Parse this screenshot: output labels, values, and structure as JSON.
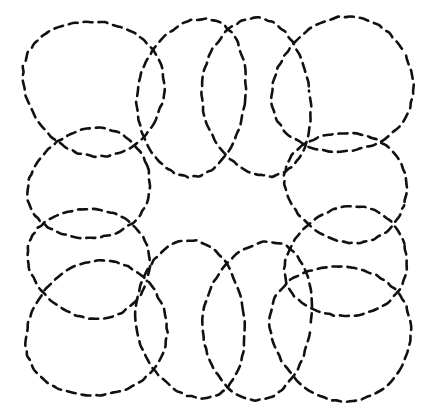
{
  "figure": {
    "kind": "line-drawing",
    "canvas": {
      "width": 433,
      "height": 416,
      "background_color": "#ffffff"
    },
    "stroke": {
      "color": "#111111",
      "width": 2.6,
      "dash_length": 9,
      "dash_gap": 6,
      "linecap": "round"
    },
    "composition": {
      "center_x": 216,
      "center_y": 207,
      "petal_count": 8,
      "bounding_box": {
        "x": 18,
        "y": 18,
        "width": 395,
        "height": 380
      },
      "central_void": "octagonal"
    },
    "petals": [
      {
        "name": "petal-top-left",
        "angle_deg": 202,
        "center_x": 92,
        "center_y": 86,
        "radius_x": 72,
        "radius_y": 66,
        "rotation_deg": 28
      },
      {
        "name": "petal-top-center-left",
        "angle_deg": 247,
        "center_x": 191,
        "center_y": 97,
        "radius_x": 54,
        "radius_y": 79,
        "rotation_deg": 8
      },
      {
        "name": "petal-top-center-right",
        "angle_deg": 292,
        "center_x": 256,
        "center_y": 98,
        "radius_x": 54,
        "radius_y": 79,
        "rotation_deg": -8
      },
      {
        "name": "petal-top-right",
        "angle_deg": 337,
        "center_x": 341,
        "center_y": 87,
        "radius_x": 72,
        "radius_y": 66,
        "rotation_deg": -28
      },
      {
        "name": "petal-left-upper",
        "angle_deg": 157,
        "center_x": 88,
        "center_y": 185,
        "radius_x": 62,
        "radius_y": 54,
        "rotation_deg": -18
      },
      {
        "name": "petal-right-upper",
        "angle_deg": 22,
        "center_x": 345,
        "center_y": 186,
        "radius_x": 62,
        "radius_y": 54,
        "rotation_deg": 18
      },
      {
        "name": "petal-left-lower",
        "angle_deg": 112,
        "center_x": 88,
        "center_y": 262,
        "radius_x": 62,
        "radius_y": 54,
        "rotation_deg": 18
      },
      {
        "name": "petal-right-lower",
        "angle_deg": 67,
        "center_x": 345,
        "center_y": 263,
        "radius_x": 62,
        "radius_y": 54,
        "rotation_deg": -18
      },
      {
        "name": "petal-bottom-left",
        "angle_deg": 157,
        "center_x": 95,
        "center_y": 331,
        "radius_x": 72,
        "radius_y": 66,
        "rotation_deg": -28
      },
      {
        "name": "petal-bottom-center-left",
        "angle_deg": 112,
        "center_x": 190,
        "center_y": 320,
        "radius_x": 54,
        "radius_y": 79,
        "rotation_deg": -8
      },
      {
        "name": "petal-bottom-center-right",
        "angle_deg": 67,
        "center_x": 257,
        "center_y": 320,
        "radius_x": 54,
        "radius_y": 79,
        "rotation_deg": 8
      },
      {
        "name": "petal-bottom-right",
        "angle_deg": 22,
        "center_x": 339,
        "center_y": 331,
        "radius_x": 72,
        "radius_y": 66,
        "rotation_deg": 28
      }
    ]
  }
}
